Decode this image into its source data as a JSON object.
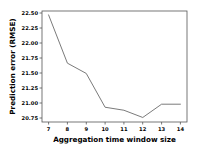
{
  "chart_data": {
    "type": "line",
    "title": "",
    "xlabel": "Aggregation time window size",
    "ylabel": "Prediction error (RMSE)",
    "x": [
      7,
      8,
      9,
      10,
      11,
      12,
      13,
      14
    ],
    "values": [
      22.48,
      21.68,
      21.51,
      20.95,
      20.9,
      20.78,
      21.0,
      21.0
    ],
    "series": [
      {
        "name": "Prediction error (RMSE)",
        "values": [
          22.48,
          21.68,
          21.51,
          20.95,
          20.9,
          20.78,
          21.0,
          21.0
        ]
      }
    ],
    "xticks": [
      "7",
      "8",
      "9",
      "10",
      "11",
      "12",
      "13",
      "14"
    ],
    "yticks": [
      "22.50",
      "22.25",
      "22.00",
      "21.75",
      "21.50",
      "21.25",
      "21.00",
      "20.75"
    ],
    "ytick_values": [
      22.5,
      22.25,
      22.0,
      21.75,
      21.5,
      21.25,
      21.0,
      20.75
    ],
    "xlim": [
      6.65,
      14.35
    ],
    "ylim": [
      20.705,
      22.545
    ],
    "grid": false,
    "legend": null,
    "line_color": "#6b6b6b",
    "axis_color": "#555555",
    "background_color": "#ffffff"
  }
}
